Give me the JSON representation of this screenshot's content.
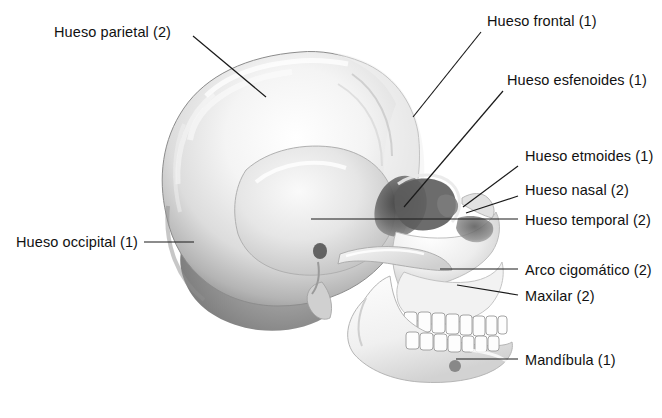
{
  "figure": {
    "language": "es",
    "background_color": "#ffffff",
    "text_color": "#111111",
    "leader_line_color": "#1a1a1a",
    "bone_fill_light": "#fdfdfd",
    "bone_fill_mid": "#d8d8d8",
    "bone_fill_dark": "#8a8a8a",
    "bone_outline": "#7b7b7b"
  },
  "labels": [
    {
      "id": "parietal",
      "text": "Hueso parietal (2)",
      "side": "left",
      "text_x": 54,
      "text_y": 24,
      "leader": {
        "x1": 193,
        "y1": 36,
        "x2": 266,
        "y2": 97
      }
    },
    {
      "id": "frontal",
      "text": "Hueso frontal (1)",
      "side": "right",
      "text_x": 487,
      "text_y": 13,
      "leader": {
        "x1": 481,
        "y1": 32,
        "x2": 413,
        "y2": 117
      }
    },
    {
      "id": "esfenoides",
      "text": "Hueso esfenoides (1)",
      "side": "right",
      "text_x": 507,
      "text_y": 72,
      "leader": {
        "x1": 503,
        "y1": 91,
        "x2": 404,
        "y2": 207
      }
    },
    {
      "id": "etmoides",
      "text": "Hueso etmoides (1)",
      "side": "right",
      "text_x": 525,
      "text_y": 148,
      "leader": {
        "x1": 518,
        "y1": 166,
        "x2": 463,
        "y2": 207
      }
    },
    {
      "id": "nasal",
      "text": "Hueso nasal (2)",
      "side": "right",
      "text_x": 525,
      "text_y": 182,
      "leader": {
        "x1": 518,
        "y1": 196,
        "x2": 466,
        "y2": 213
      }
    },
    {
      "id": "temporal",
      "text": "Hueso temporal (2)",
      "side": "right",
      "text_x": 525,
      "text_y": 212,
      "leader": {
        "x1": 518,
        "y1": 219,
        "x2": 311,
        "y2": 219
      }
    },
    {
      "id": "arco-cigomatico",
      "text": "Arco cigomático (2)",
      "side": "right",
      "text_x": 525,
      "text_y": 262,
      "leader": {
        "x1": 518,
        "y1": 269,
        "x2": 440,
        "y2": 269
      }
    },
    {
      "id": "maxilar",
      "text": "Maxilar (2)",
      "side": "right",
      "text_x": 525,
      "text_y": 288,
      "leader": {
        "x1": 518,
        "y1": 295,
        "x2": 457,
        "y2": 285
      }
    },
    {
      "id": "mandibula",
      "text": "Mandíbula (1)",
      "side": "right",
      "text_x": 525,
      "text_y": 352,
      "leader": {
        "x1": 518,
        "y1": 359,
        "x2": 456,
        "y2": 359
      }
    },
    {
      "id": "occipital",
      "text": "Hueso occipital (1)",
      "side": "left",
      "text_x": 16,
      "text_y": 234,
      "leader": {
        "x1": 144,
        "y1": 242,
        "x2": 194,
        "y2": 242
      }
    }
  ]
}
